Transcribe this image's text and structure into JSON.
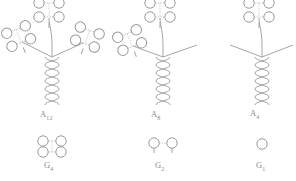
{
  "figure": {
    "type": "diagram",
    "background_color": "#ffffff",
    "stroke_color": "#9a9a9a",
    "label_color": "#8a8a8a"
  },
  "structures": [
    {
      "id": "A12",
      "label": "A",
      "subscript": "12",
      "cluster_count": 3,
      "arms": [
        "top",
        "left",
        "right"
      ],
      "arms_with_cluster": [
        "top",
        "left",
        "right"
      ],
      "bare_arms": []
    },
    {
      "id": "A8",
      "label": "A",
      "subscript": "8",
      "cluster_count": 2,
      "arms": [
        "top",
        "left",
        "right"
      ],
      "arms_with_cluster": [
        "top",
        "left"
      ],
      "bare_arms": [
        "right"
      ]
    },
    {
      "id": "A4",
      "label": "A",
      "subscript": "4",
      "cluster_count": 1,
      "arms": [
        "top",
        "left",
        "right"
      ],
      "arms_with_cluster": [
        "top"
      ],
      "bare_arms": [
        "left",
        "right"
      ]
    }
  ],
  "legend": [
    {
      "id": "G4",
      "label": "G",
      "subscript": "4",
      "circle_count": 4,
      "arrangement": "2x2"
    },
    {
      "id": "G2",
      "label": "G",
      "subscript": "2",
      "circle_count": 2,
      "arrangement": "1x2"
    },
    {
      "id": "G1",
      "label": "G",
      "subscript": "1",
      "circle_count": 1,
      "arrangement": "single"
    }
  ],
  "labels": {
    "a12": "A",
    "a12_sub": "12",
    "a8": "A",
    "a8_sub": "8",
    "a4": "A",
    "a4_sub": "4",
    "g4": "G",
    "g4_sub": "4",
    "g2": "G",
    "g2_sub": "2",
    "g1": "G",
    "g1_sub": "1"
  }
}
